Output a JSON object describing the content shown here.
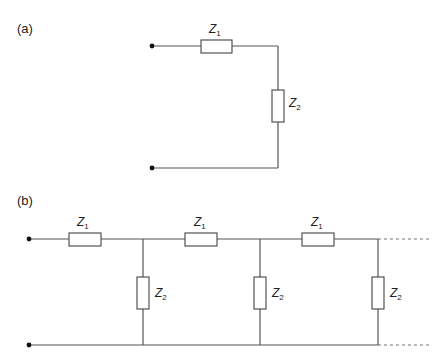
{
  "panels": {
    "a": {
      "label": "(a)",
      "series_impedance": {
        "symbol": "Z",
        "subscript": "1"
      },
      "shunt_impedance": {
        "symbol": "Z",
        "subscript": "2"
      },
      "description": "Single L-section: series Z1 followed by shunt Z2"
    },
    "b": {
      "label": "(b)",
      "sections": [
        {
          "series": {
            "symbol": "Z",
            "subscript": "1"
          },
          "shunt": {
            "symbol": "Z",
            "subscript": "2"
          }
        },
        {
          "series": {
            "symbol": "Z",
            "subscript": "1"
          },
          "shunt": {
            "symbol": "Z",
            "subscript": "2"
          }
        },
        {
          "series": {
            "symbol": "Z",
            "subscript": "1"
          },
          "shunt": {
            "symbol": "Z",
            "subscript": "2"
          }
        }
      ],
      "continuation": "dashed lines indicate the ladder continues",
      "description": "Ladder network of cascaded L-sections"
    }
  },
  "colors": {
    "wire": "#555555",
    "component_outline": "#444444",
    "terminal": "#111111",
    "text": "#222222",
    "background": "#ffffff"
  }
}
